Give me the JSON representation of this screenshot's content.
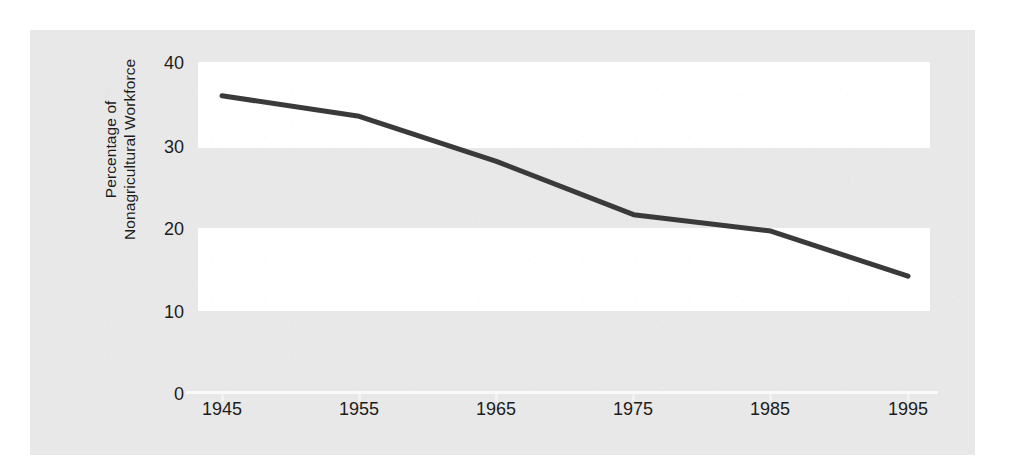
{
  "chart_data": {
    "type": "line",
    "title": "",
    "xlabel": "",
    "ylabel": "Percentage of Nonagricultural Workforce",
    "ylabel_line1": "Percentage of",
    "ylabel_line2": "Nonagricultural Workforce",
    "x": [
      1945,
      1955,
      1965,
      1975,
      1985,
      1995
    ],
    "values": [
      36,
      33.5,
      28,
      21.5,
      19.5,
      14
    ],
    "series": [
      {
        "name": "Percentage of Nonagricultural Workforce",
        "values": [
          36,
          33.5,
          28,
          21.5,
          19.5,
          14
        ]
      }
    ],
    "xtick_labels": [
      "1945",
      "1955",
      "1965",
      "1975",
      "1985",
      "1995"
    ],
    "ytick_labels": [
      "40",
      "30",
      "20",
      "10",
      "0"
    ],
    "ytick_values": [
      40,
      30,
      20,
      10,
      0
    ],
    "xlim": [
      1945,
      1995
    ],
    "ylim": [
      0,
      40
    ],
    "grid": false,
    "legend": false,
    "legend_position": "none",
    "line_color": "#3a3a3a",
    "panel_color": "#e8e8e8",
    "band_color": "#ffffff",
    "text_color": "#1c1c1c"
  }
}
